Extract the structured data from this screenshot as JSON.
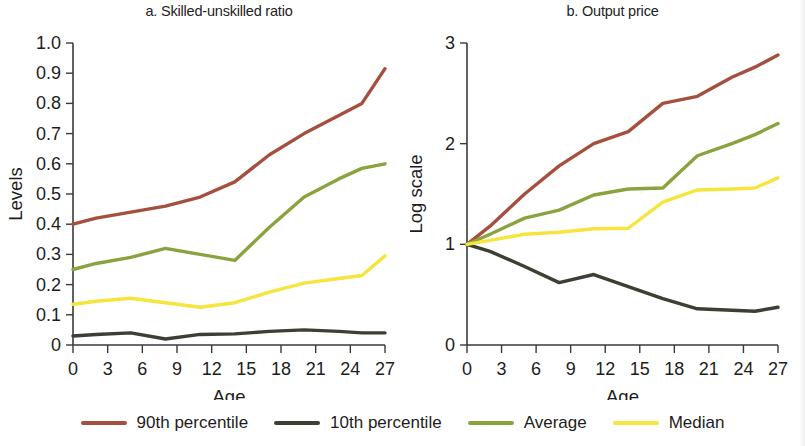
{
  "figure": {
    "background": "#ffffff",
    "panels": [
      {
        "key": "a",
        "title": "a. Skilled-unskilled ratio",
        "xlabel": "Age",
        "ylabel": "Levels"
      },
      {
        "key": "b",
        "title": "b. Output price",
        "xlabel": "Age",
        "ylabel": "Log scale"
      }
    ]
  },
  "legend": {
    "position": "bottom-center",
    "items": [
      {
        "label": "90th percentile",
        "color": "#a5503f"
      },
      {
        "label": "10th percentile",
        "color": "#3c4033"
      },
      {
        "label": "Average",
        "color": "#8aa33e"
      },
      {
        "label": "Median",
        "color": "#f5e53c"
      }
    ]
  },
  "chart_data": [
    {
      "type": "line",
      "title": "a. Skilled-unskilled ratio",
      "xlabel": "Age",
      "ylabel": "Levels",
      "x": [
        0,
        3,
        6,
        9,
        12,
        15,
        18,
        21,
        24,
        27
      ],
      "xticklabels": [
        "0",
        "3",
        "6",
        "9",
        "12",
        "15",
        "18",
        "21",
        "24",
        "27"
      ],
      "xlim": [
        0,
        27
      ],
      "ylim": [
        0,
        1.0
      ],
      "yticks": [
        0,
        0.1,
        0.2,
        0.3,
        0.4,
        0.5,
        0.6,
        0.7,
        0.8,
        0.9,
        1.0
      ],
      "yticklabels": [
        "0",
        "0.1",
        "0.2",
        "0.3",
        "0.4",
        "0.5",
        "0.6",
        "0.7",
        "0.8",
        "0.9",
        "1.0"
      ],
      "grid": false,
      "legend": "bottom",
      "series": [
        {
          "name": "90th percentile",
          "color": "#a5503f",
          "x": [
            0,
            2,
            5,
            8,
            11,
            14,
            17,
            20,
            23,
            25,
            27
          ],
          "values": [
            0.4,
            0.42,
            0.44,
            0.46,
            0.49,
            0.54,
            0.63,
            0.7,
            0.76,
            0.8,
            0.915
          ]
        },
        {
          "name": "10th percentile",
          "color": "#3c4033",
          "x": [
            0,
            2,
            5,
            8,
            11,
            14,
            17,
            20,
            23,
            25,
            27
          ],
          "values": [
            0.03,
            0.035,
            0.04,
            0.02,
            0.035,
            0.037,
            0.045,
            0.05,
            0.045,
            0.04,
            0.04
          ]
        },
        {
          "name": "Average",
          "color": "#8aa33e",
          "x": [
            0,
            2,
            5,
            8,
            11,
            14,
            17,
            20,
            23,
            25,
            27
          ],
          "values": [
            0.25,
            0.27,
            0.29,
            0.32,
            0.3,
            0.28,
            0.39,
            0.49,
            0.55,
            0.585,
            0.6
          ]
        },
        {
          "name": "Median",
          "color": "#f5e53c",
          "x": [
            0,
            2,
            5,
            8,
            11,
            14,
            17,
            20,
            23,
            25,
            27
          ],
          "values": [
            0.135,
            0.145,
            0.155,
            0.14,
            0.125,
            0.14,
            0.175,
            0.205,
            0.22,
            0.23,
            0.295
          ]
        }
      ]
    },
    {
      "type": "line",
      "title": "b. Output price",
      "xlabel": "Age",
      "ylabel": "Log scale",
      "x": [
        0,
        3,
        6,
        9,
        12,
        15,
        18,
        21,
        24,
        27
      ],
      "xticklabels": [
        "0",
        "3",
        "6",
        "9",
        "12",
        "15",
        "18",
        "21",
        "24",
        "27"
      ],
      "xlim": [
        0,
        27
      ],
      "ylim": [
        0,
        3
      ],
      "yticks": [
        0,
        1,
        2,
        3
      ],
      "yticklabels": [
        "0",
        "1",
        "2",
        "3"
      ],
      "grid": false,
      "legend": "bottom",
      "series": [
        {
          "name": "90th percentile",
          "color": "#a5503f",
          "x": [
            0,
            2,
            5,
            8,
            11,
            14,
            17,
            20,
            23,
            25,
            27
          ],
          "values": [
            1.0,
            1.18,
            1.5,
            1.78,
            2.0,
            2.12,
            2.4,
            2.47,
            2.66,
            2.76,
            2.88
          ]
        },
        {
          "name": "10th percentile",
          "color": "#3c4033",
          "x": [
            0,
            2,
            5,
            8,
            11,
            14,
            17,
            20,
            23,
            25,
            27
          ],
          "values": [
            1.0,
            0.93,
            0.78,
            0.62,
            0.7,
            0.58,
            0.46,
            0.36,
            0.345,
            0.335,
            0.375
          ]
        },
        {
          "name": "Average",
          "color": "#8aa33e",
          "x": [
            0,
            2,
            5,
            8,
            11,
            14,
            17,
            20,
            23,
            25,
            27
          ],
          "values": [
            1.0,
            1.1,
            1.26,
            1.34,
            1.49,
            1.55,
            1.56,
            1.88,
            2.0,
            2.09,
            2.2
          ]
        },
        {
          "name": "Median",
          "color": "#f5e53c",
          "x": [
            0,
            2,
            5,
            8,
            11,
            14,
            17,
            20,
            23,
            25,
            27
          ],
          "values": [
            1.0,
            1.04,
            1.1,
            1.12,
            1.155,
            1.16,
            1.42,
            1.54,
            1.55,
            1.56,
            1.66
          ]
        }
      ]
    }
  ]
}
